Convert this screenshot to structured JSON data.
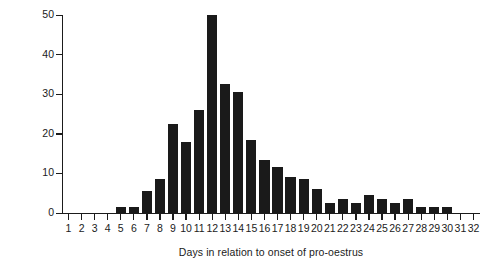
{
  "chart_data": {
    "type": "bar",
    "title": "",
    "subtitle": "",
    "xlabel": "Days in relation to onset of pro-oestrus",
    "ylabel": "Number of pregnancies",
    "categories": [
      1,
      2,
      3,
      4,
      5,
      6,
      7,
      8,
      9,
      10,
      11,
      12,
      13,
      14,
      15,
      16,
      17,
      18,
      19,
      20,
      21,
      22,
      23,
      24,
      25,
      26,
      27,
      28,
      29,
      30,
      31,
      32
    ],
    "values": [
      0,
      0,
      0,
      0,
      1.5,
      1.5,
      5.5,
      8.5,
      22.5,
      18,
      26,
      50,
      32.5,
      30.5,
      18.5,
      13.5,
      11.5,
      9,
      8.5,
      6,
      2.5,
      3.5,
      2.5,
      4.5,
      3.5,
      2.5,
      3.5,
      1.5,
      1.5,
      1.5,
      0,
      0
    ],
    "xlim": [
      0.5,
      32.5
    ],
    "ylim": [
      0,
      50
    ],
    "yticks": [
      0,
      10,
      20,
      30,
      40,
      50
    ],
    "ytick_labels": [
      "0",
      "10",
      "20",
      "30",
      "40",
      "50"
    ],
    "xticks": [
      1,
      2,
      3,
      4,
      5,
      6,
      7,
      8,
      9,
      10,
      11,
      12,
      13,
      14,
      15,
      16,
      17,
      18,
      19,
      20,
      21,
      22,
      23,
      24,
      25,
      26,
      27,
      28,
      29,
      30,
      31,
      32
    ],
    "xtick_labels": [
      "1",
      "2",
      "3",
      "4",
      "5",
      "6",
      "7",
      "8",
      "9",
      "10",
      "11",
      "12",
      "13",
      "14",
      "15",
      "16",
      "17",
      "18",
      "19",
      "20",
      "21",
      "22",
      "23",
      "24",
      "25",
      "26",
      "27",
      "28",
      "29",
      "30",
      "31",
      "32"
    ],
    "grid": false,
    "legend": false,
    "legend_position": "none",
    "bar_color": "#1a1a1a",
    "axis_color": "#1b1b1b",
    "background_color": "#ffffff"
  }
}
